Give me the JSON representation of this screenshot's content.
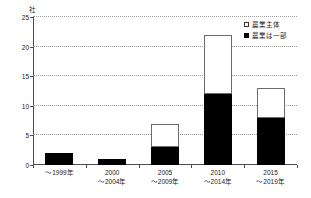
{
  "chart_data": {
    "type": "bar",
    "stacked": true,
    "title": "",
    "subtitle": "",
    "xlabel": "",
    "ylabel": "",
    "unit_label": "社",
    "categories": [
      {
        "line1": "～1999年",
        "line2": ""
      },
      {
        "line1": "2000",
        "line2": "～2004年"
      },
      {
        "line1": "2005",
        "line2": "～2009年"
      },
      {
        "line1": "2010",
        "line2": "～2014年"
      },
      {
        "line1": "2015",
        "line2": "～2019年"
      }
    ],
    "series": [
      {
        "name": "農業は一部",
        "color": "#000000",
        "values": [
          2,
          1,
          3,
          12,
          8
        ]
      },
      {
        "name": "農業主体",
        "color": "#ffffff",
        "values": [
          0,
          0,
          4,
          10,
          5
        ]
      }
    ],
    "totals": [
      2,
      1,
      7,
      22,
      13
    ],
    "ylim": [
      0,
      25
    ],
    "yticks": [
      0,
      5,
      10,
      15,
      20,
      25
    ],
    "ytick_labels": [
      "0",
      "5",
      "10",
      "15",
      "20",
      "25"
    ],
    "grid": true,
    "legend_position": "top-right"
  },
  "legend": {
    "items": [
      {
        "label": "農業主体",
        "swatch": "open-square-icon"
      },
      {
        "label": "農業は一部",
        "swatch": "filled-square-icon"
      }
    ]
  }
}
